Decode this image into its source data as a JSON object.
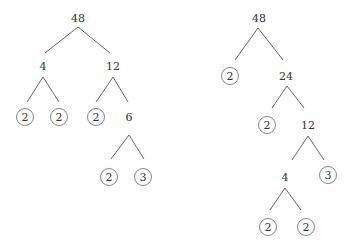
{
  "trees": [
    {
      "name": "factor-tree-left",
      "nodes": [
        {
          "id": "a",
          "value": "48",
          "x": 78,
          "y": 18,
          "prime": false
        },
        {
          "id": "b",
          "value": "4",
          "x": 43,
          "y": 66,
          "prime": false
        },
        {
          "id": "c",
          "value": "12",
          "x": 113,
          "y": 66,
          "prime": false
        },
        {
          "id": "d",
          "value": "2",
          "x": 25,
          "y": 117,
          "prime": true
        },
        {
          "id": "e",
          "value": "2",
          "x": 59,
          "y": 117,
          "prime": true
        },
        {
          "id": "f",
          "value": "2",
          "x": 96,
          "y": 117,
          "prime": true
        },
        {
          "id": "g",
          "value": "6",
          "x": 129,
          "y": 117,
          "prime": false
        },
        {
          "id": "h",
          "value": "2",
          "x": 109,
          "y": 177,
          "prime": true
        },
        {
          "id": "i",
          "value": "3",
          "x": 143,
          "y": 177,
          "prime": true
        }
      ],
      "edges": [
        [
          78,
          27,
          45,
          53
        ],
        [
          78,
          27,
          110,
          53
        ],
        [
          43,
          77,
          27,
          102
        ],
        [
          43,
          77,
          59,
          102
        ],
        [
          113,
          77,
          96,
          102
        ],
        [
          113,
          77,
          128,
          102
        ],
        [
          129,
          135,
          111,
          159
        ],
        [
          129,
          135,
          144,
          159
        ]
      ]
    },
    {
      "name": "factor-tree-right",
      "nodes": [
        {
          "id": "a",
          "value": "48",
          "x": 259,
          "y": 18,
          "prime": false
        },
        {
          "id": "b",
          "value": "2",
          "x": 230,
          "y": 76,
          "prime": true
        },
        {
          "id": "c",
          "value": "24",
          "x": 286,
          "y": 76,
          "prime": false
        },
        {
          "id": "d",
          "value": "2",
          "x": 267,
          "y": 125,
          "prime": true
        },
        {
          "id": "e",
          "value": "12",
          "x": 308,
          "y": 125,
          "prime": false
        },
        {
          "id": "f",
          "value": "4",
          "x": 285,
          "y": 177,
          "prime": false
        },
        {
          "id": "g",
          "value": "3",
          "x": 328,
          "y": 175,
          "prime": true
        },
        {
          "id": "h",
          "value": "2",
          "x": 268,
          "y": 227,
          "prime": true
        },
        {
          "id": "i",
          "value": "2",
          "x": 306,
          "y": 227,
          "prime": true
        }
      ],
      "edges": [
        [
          258,
          28,
          235,
          60
        ],
        [
          258,
          28,
          283,
          60
        ],
        [
          287,
          86,
          272,
          108
        ],
        [
          287,
          86,
          304,
          108
        ],
        [
          308,
          136,
          292,
          160
        ],
        [
          308,
          136,
          324,
          160
        ],
        [
          285,
          188,
          270,
          210
        ],
        [
          285,
          188,
          301,
          210
        ]
      ]
    }
  ]
}
